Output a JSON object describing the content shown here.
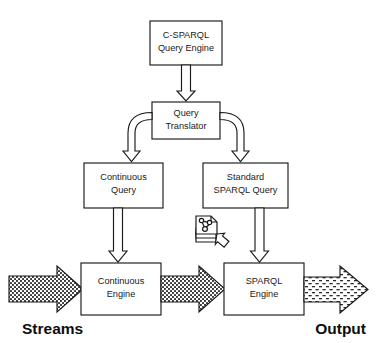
{
  "diagram": {
    "type": "flow-diagram",
    "background_color": "#ffffff",
    "line_color": "#1a1a1a",
    "nodes": {
      "csparql_engine": {
        "line1": "C-SPARQL",
        "line2": "Query Engine"
      },
      "query_translator": {
        "line1": "Query",
        "line2": "Translator"
      },
      "continuous_query": {
        "line1": "Continuous",
        "line2": "Query"
      },
      "standard_sparql_query": {
        "line1": "Standard",
        "line2": "SPARQL Query"
      },
      "continuous_engine": {
        "line1": "Continuous",
        "line2": "Engine"
      },
      "sparql_engine": {
        "line1": "SPARQL",
        "line2": "Engine"
      }
    },
    "endpoints": {
      "input_label": "Streams",
      "output_label": "Output"
    },
    "icons": {
      "rdf_graph_stack": "rdf-graph-document-stack-icon",
      "feed_arrow": "feed-arrow-icon"
    },
    "connectors": [
      {
        "name": "csparql-to-translator",
        "from": "csparql_engine",
        "to": "query_translator",
        "style": "block-arrow-down"
      },
      {
        "name": "translator-to-continuous-query",
        "from": "query_translator",
        "to": "continuous_query",
        "style": "curved-block-arrow-left-down"
      },
      {
        "name": "translator-to-standard-query",
        "from": "query_translator",
        "to": "standard_sparql_query",
        "style": "curved-block-arrow-right-down"
      },
      {
        "name": "continuous-query-to-continuous-engine",
        "from": "continuous_query",
        "to": "continuous_engine",
        "style": "block-arrow-down"
      },
      {
        "name": "standard-query-to-sparql-engine",
        "from": "standard_sparql_query",
        "to": "sparql_engine",
        "style": "block-arrow-down"
      },
      {
        "name": "streams-to-continuous-engine",
        "from": "input_label",
        "to": "continuous_engine",
        "style": "dense-dotted-stream-arrow"
      },
      {
        "name": "continuous-engine-to-sparql-engine",
        "from": "continuous_engine",
        "to": "sparql_engine",
        "style": "dense-dotted-stream-arrow"
      },
      {
        "name": "sparql-engine-to-output",
        "from": "sparql_engine",
        "to": "output_label",
        "style": "sparse-dotted-stream-arrow"
      },
      {
        "name": "rdf-store-to-sparql-engine",
        "from": "rdf_graph_stack",
        "to": "sparql_engine",
        "style": "small-block-arrow-diagonal"
      }
    ]
  }
}
